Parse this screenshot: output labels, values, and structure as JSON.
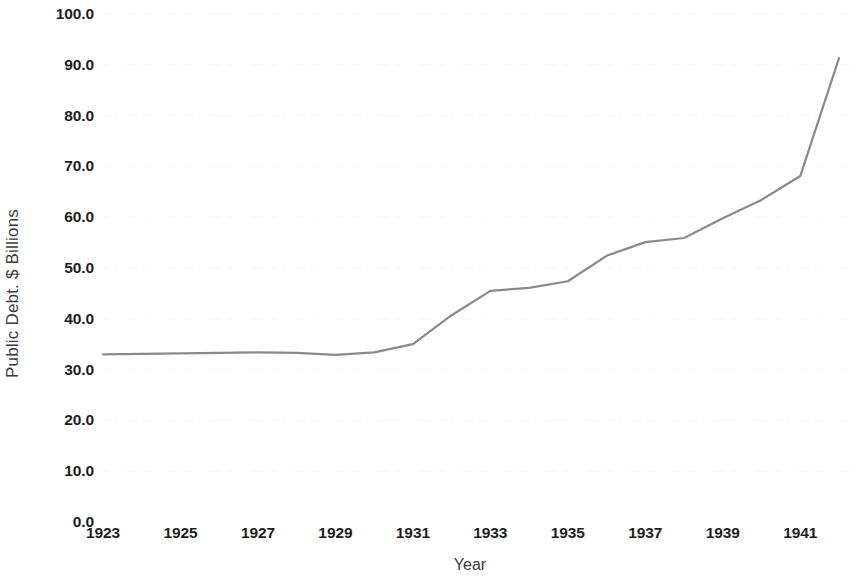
{
  "chart_data": {
    "type": "line",
    "title": "",
    "xlabel": "Year",
    "ylabel": "Public Debt. $ Billions",
    "xlim": [
      1923,
      1942
    ],
    "ylim": [
      0.0,
      100.0
    ],
    "grid": true,
    "legend": "none",
    "line_color": "#8a8a8a",
    "x": [
      1923,
      1924,
      1925,
      1926,
      1927,
      1928,
      1929,
      1930,
      1931,
      1932,
      1933,
      1934,
      1935,
      1936,
      1937,
      1938,
      1939,
      1940,
      1941,
      1942
    ],
    "values": [
      33.0,
      33.1,
      33.2,
      33.3,
      33.4,
      33.3,
      32.9,
      33.4,
      35.0,
      40.7,
      45.5,
      46.1,
      47.4,
      52.4,
      55.1,
      55.9,
      59.8,
      63.4,
      68.1,
      91.3
    ],
    "series": [
      {
        "name": "Public Debt",
        "values": [
          33.0,
          33.1,
          33.2,
          33.3,
          33.4,
          33.3,
          32.9,
          33.4,
          35.0,
          40.7,
          45.5,
          46.1,
          47.4,
          52.4,
          55.1,
          55.9,
          59.8,
          63.4,
          68.1,
          91.3
        ]
      }
    ],
    "x_tick_labels": [
      "1923",
      "1925",
      "1927",
      "1929",
      "1931",
      "1933",
      "1935",
      "1937",
      "1939",
      "1941"
    ],
    "x_tick_values": [
      1923,
      1925,
      1927,
      1929,
      1931,
      1933,
      1935,
      1937,
      1939,
      1941
    ],
    "y_tick_labels": [
      "100.0",
      "90.0",
      "80.0",
      "70.0",
      "60.0",
      "50.0",
      "40.0",
      "30.0",
      "20.0",
      "10.0",
      "0.0"
    ],
    "y_tick_values": [
      100.0,
      90.0,
      80.0,
      70.0,
      60.0,
      50.0,
      40.0,
      30.0,
      20.0,
      10.0,
      0.0
    ]
  }
}
